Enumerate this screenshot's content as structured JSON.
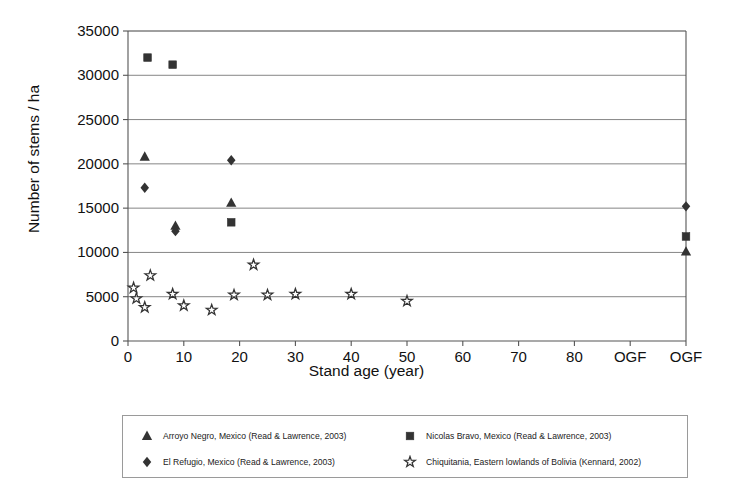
{
  "chart_data": {
    "type": "scatter",
    "title": "",
    "xlabel": "Stand age (year)",
    "ylabel": "Number of stems / ha",
    "xlim": [
      0,
      100
    ],
    "ylim": [
      0,
      35000
    ],
    "grid": true,
    "legend_position": "bottom",
    "x_ticks": [
      {
        "value": 0,
        "label": "0"
      },
      {
        "value": 10,
        "label": "10"
      },
      {
        "value": 20,
        "label": "20"
      },
      {
        "value": 30,
        "label": "30"
      },
      {
        "value": 40,
        "label": "40"
      },
      {
        "value": 50,
        "label": "50"
      },
      {
        "value": 60,
        "label": "60"
      },
      {
        "value": 70,
        "label": "70"
      },
      {
        "value": 80,
        "label": "80"
      },
      {
        "value": 90,
        "label": "OGF"
      },
      {
        "value": 100,
        "label": "OGF"
      }
    ],
    "y_ticks": [
      {
        "value": 0,
        "label": "0"
      },
      {
        "value": 5000,
        "label": "5000"
      },
      {
        "value": 10000,
        "label": "10000"
      },
      {
        "value": 15000,
        "label": "15000"
      },
      {
        "value": 20000,
        "label": "20000"
      },
      {
        "value": 25000,
        "label": "25000"
      },
      {
        "value": 30000,
        "label": "30000"
      },
      {
        "value": 35000,
        "label": "35000"
      }
    ],
    "series": [
      {
        "name": "Arroyo Negro, Mexico (Read & Lawrence, 2003)",
        "marker": "triangle",
        "color": "#333333",
        "points": [
          {
            "x": 3,
            "y": 20800
          },
          {
            "x": 8.5,
            "y": 13000
          },
          {
            "x": 18.5,
            "y": 15600
          },
          {
            "x": 100,
            "y": 10100
          }
        ]
      },
      {
        "name": "Nicolas Bravo, Mexico (Read & Lawrence, 2003)",
        "marker": "square",
        "color": "#333333",
        "points": [
          {
            "x": 3.5,
            "y": 32000
          },
          {
            "x": 8,
            "y": 31200
          },
          {
            "x": 18.5,
            "y": 13400
          },
          {
            "x": 100,
            "y": 11800
          }
        ]
      },
      {
        "name": "El Refugio, Mexico (Read & Lawrence, 2003)",
        "marker": "diamond",
        "color": "#333333",
        "points": [
          {
            "x": 3,
            "y": 17300
          },
          {
            "x": 8.5,
            "y": 12400
          },
          {
            "x": 18.5,
            "y": 20400
          },
          {
            "x": 100,
            "y": 15200
          }
        ]
      },
      {
        "name": "Chiquitania, Eastern lowlands of Bolivia (Kennard, 2002)",
        "marker": "star",
        "color": "#333333",
        "points": [
          {
            "x": 1,
            "y": 6000
          },
          {
            "x": 1.5,
            "y": 4800
          },
          {
            "x": 3,
            "y": 3800
          },
          {
            "x": 4,
            "y": 7400
          },
          {
            "x": 8,
            "y": 5300
          },
          {
            "x": 10,
            "y": 4000
          },
          {
            "x": 15,
            "y": 3500
          },
          {
            "x": 19,
            "y": 5200
          },
          {
            "x": 22.5,
            "y": 8600
          },
          {
            "x": 25,
            "y": 5200
          },
          {
            "x": 30,
            "y": 5300
          },
          {
            "x": 40,
            "y": 5300
          },
          {
            "x": 50,
            "y": 4500
          }
        ]
      }
    ]
  },
  "legend": {
    "entries": [
      {
        "label": "Arroyo Negro, Mexico (Read & Lawrence, 2003)",
        "marker": "triangle"
      },
      {
        "label": "Nicolas Bravo, Mexico (Read & Lawrence, 2003)",
        "marker": "square"
      },
      {
        "label": "El Refugio, Mexico (Read & Lawrence, 2003)",
        "marker": "diamond"
      },
      {
        "label": "Chiquitania, Eastern lowlands of Bolivia (Kennard, 2002)",
        "marker": "star"
      }
    ]
  },
  "colors": {
    "marker": "#333333",
    "axis": "#555555",
    "grid": "#777777",
    "text": "#111111"
  }
}
